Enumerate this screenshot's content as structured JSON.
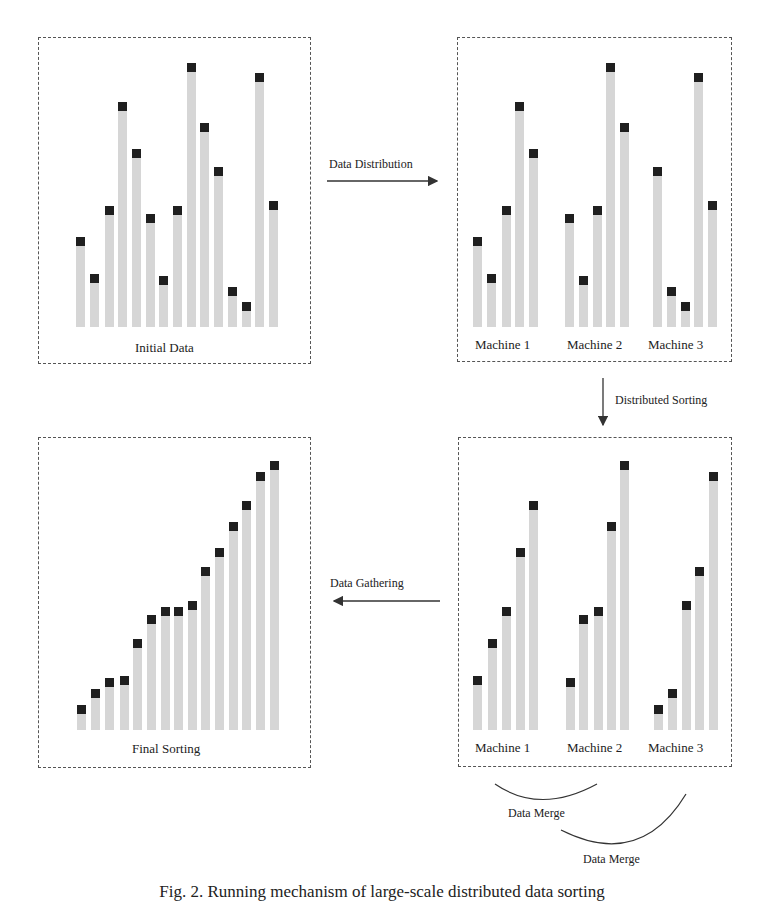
{
  "figure": {
    "caption": "Fig. 2. Running mechanism of large-scale distributed data sorting",
    "colors": {
      "bar": "#d6d6d6",
      "marker": "#1f1f1f",
      "border": "#555555",
      "arrow": "#333333"
    }
  },
  "panels": {
    "initial": {
      "label": "Initial Data"
    },
    "distributed": {
      "machine_labels": [
        "Machine 1",
        "Machine 2",
        "Machine 3"
      ]
    },
    "sorted_local": {
      "machine_labels": [
        "Machine 1",
        "Machine 2",
        "Machine 3"
      ]
    },
    "final": {
      "label": "Final Sorting"
    }
  },
  "arrows": {
    "distribution": "Data Distribution",
    "sorting": "Distributed Sorting",
    "gathering": "Data Gathering",
    "merge_1": "Data Merge",
    "merge_2": "Data Merge"
  },
  "chart_data": [
    {
      "type": "bar",
      "title": "Initial Data",
      "categories": [
        "1",
        "2",
        "3",
        "4",
        "5",
        "6",
        "7",
        "8",
        "9",
        "10",
        "11",
        "12",
        "13",
        "14",
        "15"
      ],
      "values": [
        33,
        19,
        45,
        85,
        67,
        42,
        18,
        45,
        100,
        77,
        60,
        14,
        8,
        96,
        47
      ]
    },
    {
      "type": "bar",
      "title": "Data Distribution",
      "series": [
        {
          "name": "Machine 1",
          "values": [
            33,
            19,
            45,
            85,
            67
          ]
        },
        {
          "name": "Machine 2",
          "values": [
            42,
            18,
            45,
            100,
            77
          ]
        },
        {
          "name": "Machine 3",
          "values": [
            60,
            14,
            8,
            96,
            47
          ]
        }
      ]
    },
    {
      "type": "bar",
      "title": "Distributed Sorting",
      "series": [
        {
          "name": "Machine 1",
          "values": [
            19,
            33,
            45,
            67,
            85
          ]
        },
        {
          "name": "Machine 2",
          "values": [
            18,
            42,
            45,
            77,
            100
          ]
        },
        {
          "name": "Machine 3",
          "values": [
            8,
            14,
            47,
            60,
            96
          ]
        }
      ]
    },
    {
      "type": "bar",
      "title": "Final Sorting",
      "categories": [
        "1",
        "2",
        "3",
        "4",
        "5",
        "6",
        "7",
        "8",
        "9",
        "10",
        "11",
        "12",
        "13",
        "14",
        "15"
      ],
      "values": [
        8,
        14,
        18,
        19,
        33,
        42,
        45,
        45,
        47,
        60,
        67,
        77,
        85,
        96,
        100
      ]
    }
  ]
}
